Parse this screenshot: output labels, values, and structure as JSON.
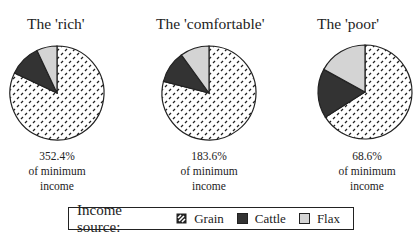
{
  "chart_data": [
    {
      "type": "pie",
      "title": "The 'rich'",
      "caption": [
        "352.4%",
        "of minimum",
        "income"
      ],
      "categories": [
        "Grain",
        "Cattle",
        "Flax"
      ],
      "values": [
        82,
        11,
        7
      ],
      "units": "% of income (estimated)"
    },
    {
      "type": "pie",
      "title": "The 'comfortable'",
      "caption": [
        "183.6%",
        "of minimum",
        "income"
      ],
      "categories": [
        "Grain",
        "Cattle",
        "Flax"
      ],
      "values": [
        79,
        11,
        10
      ],
      "units": "% of income (estimated)"
    },
    {
      "type": "pie",
      "title": "The 'poor'",
      "caption": [
        "68.6%",
        "of minimum",
        "income"
      ],
      "categories": [
        "Grain",
        "Cattle",
        "Flax"
      ],
      "values": [
        66,
        17,
        17
      ],
      "units": "% of income (estimated)"
    }
  ],
  "legend": {
    "title": "Income source:",
    "position": "bottom",
    "items": [
      {
        "label": "Grain",
        "fill": "hatched",
        "color": "#ffffff"
      },
      {
        "label": "Cattle",
        "fill": "solid",
        "color": "#333333"
      },
      {
        "label": "Flax",
        "fill": "solid",
        "color": "#d4d4d4"
      }
    ]
  },
  "colors": {
    "grain": "#ffffff",
    "cattle": "#333333",
    "flax": "#d4d4d4",
    "outline": "#222222"
  }
}
